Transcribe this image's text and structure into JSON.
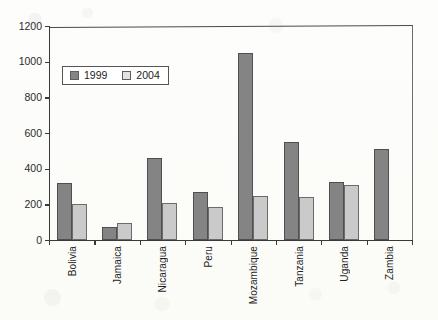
{
  "chart_data": {
    "type": "bar",
    "title": "",
    "subtitle": "",
    "xlabel": "",
    "ylabel": "",
    "ylim": [
      0,
      1200
    ],
    "ytick_step": 200,
    "yticks": [
      "1200",
      "1000",
      "800",
      "600",
      "400",
      "200",
      "0"
    ],
    "grid": false,
    "legend_position": "inside-upper-left",
    "categories": [
      "Bolivia",
      "Jamaica",
      "Nicaragua",
      "Peru",
      "Mozambique",
      "Tanzania",
      "Uganda",
      "Zambia"
    ],
    "series": [
      {
        "name": "1999",
        "color": "#848484",
        "values": [
          317,
          75,
          460,
          267,
          1050,
          548,
          323,
          512
        ]
      },
      {
        "name": "2004",
        "color": "#cacaca",
        "values": [
          200,
          97,
          205,
          185,
          245,
          243,
          310,
          null
        ]
      }
    ]
  },
  "legend": {
    "entries": [
      {
        "label": "1999",
        "swatch": "dark-gray-swatch"
      },
      {
        "label": "2004",
        "swatch": "light-gray-swatch"
      }
    ]
  },
  "colors": {
    "series_1999": "#848484",
    "series_2004": "#cacaca",
    "axis": "#3a3a3a",
    "text": "#1f1f1f",
    "background": "#fdfdfb"
  }
}
